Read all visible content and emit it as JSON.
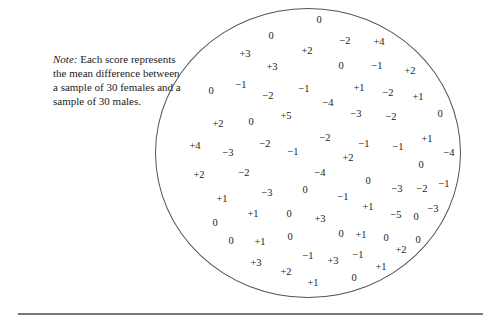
{
  "note": {
    "label": "Note:",
    "text": " Each score represents the mean difference between a sample of 30 females and a sample of 30 males."
  },
  "scores": [
    {
      "v": "0",
      "x": 319,
      "y": 20
    },
    {
      "v": "0",
      "x": 271,
      "y": 36
    },
    {
      "v": "−2",
      "x": 345,
      "y": 41
    },
    {
      "v": "+4",
      "x": 379,
      "y": 42
    },
    {
      "v": "+3",
      "x": 245,
      "y": 54
    },
    {
      "v": "+2",
      "x": 307,
      "y": 51
    },
    {
      "v": "+3",
      "x": 272,
      "y": 67
    },
    {
      "v": "0",
      "x": 341,
      "y": 66
    },
    {
      "v": "−1",
      "x": 377,
      "y": 66
    },
    {
      "v": "+2",
      "x": 410,
      "y": 71
    },
    {
      "v": "0",
      "x": 211,
      "y": 91
    },
    {
      "v": "−1",
      "x": 241,
      "y": 85
    },
    {
      "v": "−2",
      "x": 268,
      "y": 96
    },
    {
      "v": "−1",
      "x": 304,
      "y": 89
    },
    {
      "v": "−4",
      "x": 328,
      "y": 103
    },
    {
      "v": "+1",
      "x": 359,
      "y": 88
    },
    {
      "v": "−2",
      "x": 388,
      "y": 93
    },
    {
      "v": "+1",
      "x": 418,
      "y": 97
    },
    {
      "v": "+2",
      "x": 218,
      "y": 124
    },
    {
      "v": "0",
      "x": 251,
      "y": 122
    },
    {
      "v": "+5",
      "x": 286,
      "y": 116
    },
    {
      "v": "−3",
      "x": 356,
      "y": 114
    },
    {
      "v": "−2",
      "x": 391,
      "y": 117
    },
    {
      "v": "0",
      "x": 440,
      "y": 114
    },
    {
      "v": "+4",
      "x": 195,
      "y": 146
    },
    {
      "v": "−3",
      "x": 228,
      "y": 153
    },
    {
      "v": "−2",
      "x": 265,
      "y": 144
    },
    {
      "v": "−1",
      "x": 293,
      "y": 152
    },
    {
      "v": "−2",
      "x": 325,
      "y": 138
    },
    {
      "v": "−1",
      "x": 364,
      "y": 144
    },
    {
      "v": "−1",
      "x": 398,
      "y": 147
    },
    {
      "v": "+1",
      "x": 427,
      "y": 139
    },
    {
      "v": "−4",
      "x": 449,
      "y": 153
    },
    {
      "v": "+2",
      "x": 348,
      "y": 158
    },
    {
      "v": "+2",
      "x": 199,
      "y": 175
    },
    {
      "v": "−2",
      "x": 244,
      "y": 173
    },
    {
      "v": "−4",
      "x": 320,
      "y": 173
    },
    {
      "v": "0",
      "x": 421,
      "y": 165
    },
    {
      "v": "0",
      "x": 368,
      "y": 181
    },
    {
      "v": "−3",
      "x": 397,
      "y": 189
    },
    {
      "v": "−2",
      "x": 422,
      "y": 189
    },
    {
      "v": "−1",
      "x": 444,
      "y": 184
    },
    {
      "v": "+1",
      "x": 222,
      "y": 199
    },
    {
      "v": "−3",
      "x": 267,
      "y": 193
    },
    {
      "v": "0",
      "x": 305,
      "y": 190
    },
    {
      "v": "−1",
      "x": 343,
      "y": 197
    },
    {
      "v": "+1",
      "x": 253,
      "y": 214
    },
    {
      "v": "0",
      "x": 289,
      "y": 214
    },
    {
      "v": "+3",
      "x": 320,
      "y": 219
    },
    {
      "v": "+1",
      "x": 368,
      "y": 207
    },
    {
      "v": "−5",
      "x": 396,
      "y": 215
    },
    {
      "v": "0",
      "x": 416,
      "y": 217
    },
    {
      "v": "−3",
      "x": 433,
      "y": 209
    },
    {
      "v": "0",
      "x": 215,
      "y": 223
    },
    {
      "v": "0",
      "x": 231,
      "y": 241
    },
    {
      "v": "+1",
      "x": 260,
      "y": 242
    },
    {
      "v": "0",
      "x": 290,
      "y": 237
    },
    {
      "v": "0",
      "x": 341,
      "y": 234
    },
    {
      "v": "+1",
      "x": 361,
      "y": 235
    },
    {
      "v": "0",
      "x": 386,
      "y": 238
    },
    {
      "v": "+2",
      "x": 401,
      "y": 250
    },
    {
      "v": "0",
      "x": 418,
      "y": 240
    },
    {
      "v": "+3",
      "x": 256,
      "y": 263
    },
    {
      "v": "−1",
      "x": 308,
      "y": 256
    },
    {
      "v": "+3",
      "x": 333,
      "y": 261
    },
    {
      "v": "−1",
      "x": 358,
      "y": 255
    },
    {
      "v": "+2",
      "x": 286,
      "y": 272
    },
    {
      "v": "+1",
      "x": 381,
      "y": 267
    },
    {
      "v": "+1",
      "x": 313,
      "y": 283
    },
    {
      "v": "0",
      "x": 354,
      "y": 278
    }
  ]
}
